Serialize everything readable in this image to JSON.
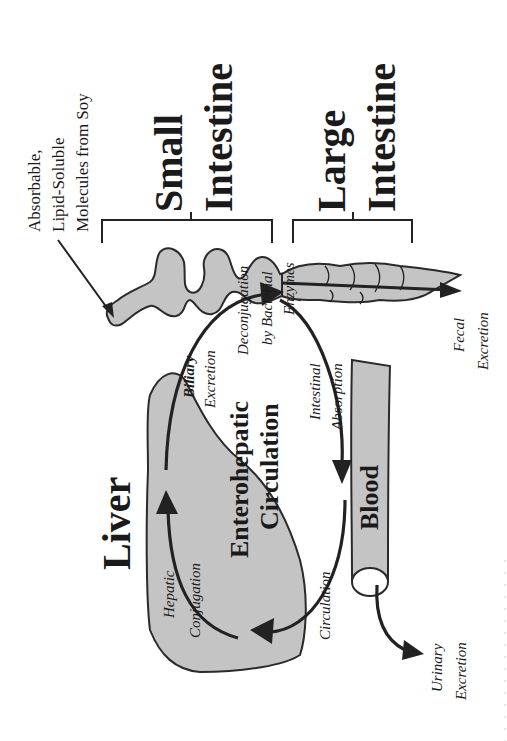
{
  "diagram": {
    "orientation": "rotated 90 degrees counter-clockwise",
    "colors": {
      "organ_fill": "#c4c4c4",
      "stroke": "#222222",
      "background": "#ffffff"
    },
    "input_label": [
      "Absorbable,",
      "Lipid-Soluble",
      "Molecules from Soy"
    ],
    "sections": {
      "small_intestine": [
        "Small",
        "Intestine"
      ],
      "large_intestine": [
        "Large",
        "Intestine"
      ]
    },
    "organs": {
      "liver": "Liver",
      "blood": "Blood"
    },
    "center_label": [
      "Enterohepatic",
      "Circulation"
    ],
    "process_labels": {
      "biliary_excretion": [
        "Biliary",
        "Excretion"
      ],
      "deconjugation": [
        "Deconjugation",
        "by Bacterial",
        "Enzymes"
      ],
      "intestinal_absorption": [
        "Intestinal",
        "Absorption"
      ],
      "circulation": "Circulation",
      "hepatic_conjugation": [
        "Hepatic",
        "Conjugation"
      ],
      "fecal_excretion": [
        "Fecal",
        "Excretion"
      ],
      "urinary_excretion": [
        "Urinary",
        "Excretion"
      ]
    }
  }
}
